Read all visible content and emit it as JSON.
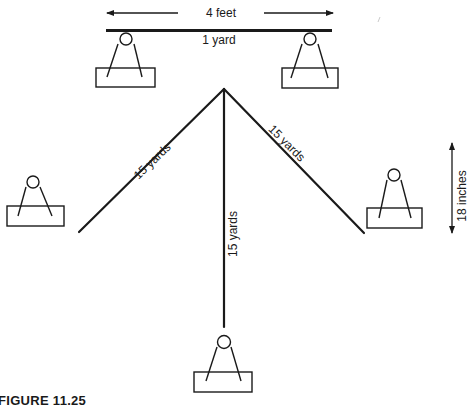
{
  "figure": {
    "caption": "FIGURE 11.25",
    "top_dimension_label": "4 feet",
    "bar_label": "1 yard",
    "side_dimension_label": "18 inches",
    "line_labels": {
      "left": "15 yards",
      "center": "15 yards",
      "right": "15 yards"
    }
  },
  "colors": {
    "ink": "#1a1a1a",
    "background": "#ffffff"
  },
  "elements": {
    "stands": [
      {
        "name": "top-left-stand",
        "cx": 126,
        "cy": 39
      },
      {
        "name": "top-right-stand",
        "cx": 310,
        "cy": 39
      },
      {
        "name": "left-stand",
        "cx": 33,
        "cy": 182
      },
      {
        "name": "right-stand",
        "cx": 394,
        "cy": 175
      },
      {
        "name": "bottom-stand",
        "cx": 224,
        "cy": 342
      }
    ],
    "apex": {
      "x": 224,
      "y": 89
    }
  }
}
